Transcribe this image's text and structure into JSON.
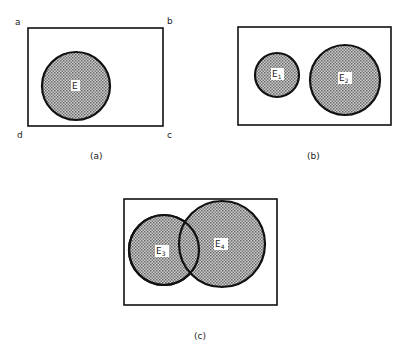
{
  "panels": {
    "a": {
      "caption": "(a)",
      "corners": {
        "a": "a",
        "b": "b",
        "c": "c",
        "d": "d"
      },
      "events": [
        {
          "label": "E",
          "sub": ""
        }
      ]
    },
    "b": {
      "caption": "(b)",
      "events": [
        {
          "label": "E",
          "sub": "1"
        },
        {
          "label": "E",
          "sub": "2"
        }
      ]
    },
    "c": {
      "caption": "(c)",
      "events": [
        {
          "label": "E",
          "sub": "3"
        },
        {
          "label": "E",
          "sub": "4"
        }
      ]
    }
  },
  "colors": {
    "stroke": "#111111",
    "fill_dot": "#555555",
    "fill_bg": "#c8c8c8"
  }
}
